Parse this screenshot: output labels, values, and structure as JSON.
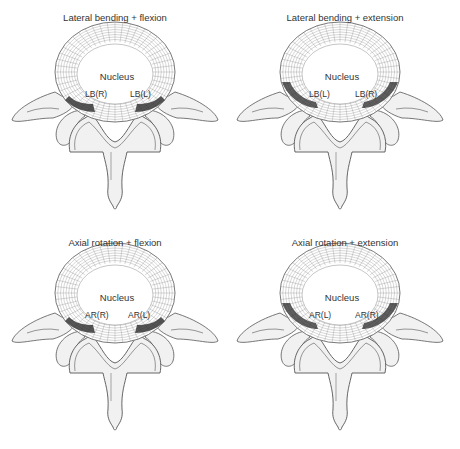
{
  "figure": {
    "panels": [
      {
        "id": "lb-flex",
        "title": "Lateral bending + flexion",
        "nucleus_label": "Nucleus",
        "left_label": "LB(R)",
        "right_label": "LB(L)",
        "stress_region": "posterior-central"
      },
      {
        "id": "lb-ext",
        "title": "Lateral bending + extension",
        "nucleus_label": "Nucleus",
        "left_label": "LB(L)",
        "right_label": "LB(R)",
        "stress_region": "posterolateral"
      },
      {
        "id": "ar-flex",
        "title": "Axial rotation + flexion",
        "nucleus_label": "Nucleus",
        "left_label": "AR(R)",
        "right_label": "AR(L)",
        "stress_region": "posterior-central"
      },
      {
        "id": "ar-ext",
        "title": "Axial rotation + extension",
        "nucleus_label": "Nucleus",
        "left_label": "AR(L)",
        "right_label": "AR(R)",
        "stress_region": "posterolateral"
      }
    ],
    "colors": {
      "bone_fill": "#f1f1f1",
      "outline": "#555555",
      "mesh": "#8a8a8a",
      "stress": "#2a2a2a",
      "text": "#333333"
    }
  }
}
